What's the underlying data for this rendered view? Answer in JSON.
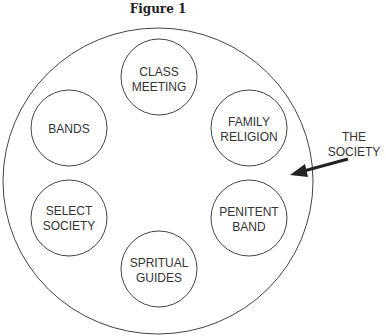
{
  "title": "Figure 1",
  "outer": {
    "label_line1": "THE",
    "label_line2": "SOCIETY"
  },
  "groups": [
    {
      "line1": "CLASS",
      "line2": "MEETING"
    },
    {
      "line1": "BANDS",
      "line2": ""
    },
    {
      "line1": "FAMILY",
      "line2": "RELIGION"
    },
    {
      "line1": "SELECT",
      "line2": "SOCIETY"
    },
    {
      "line1": "PENITENT",
      "line2": "BAND"
    },
    {
      "line1": "SPRITUAL",
      "line2": "GUIDES"
    }
  ]
}
